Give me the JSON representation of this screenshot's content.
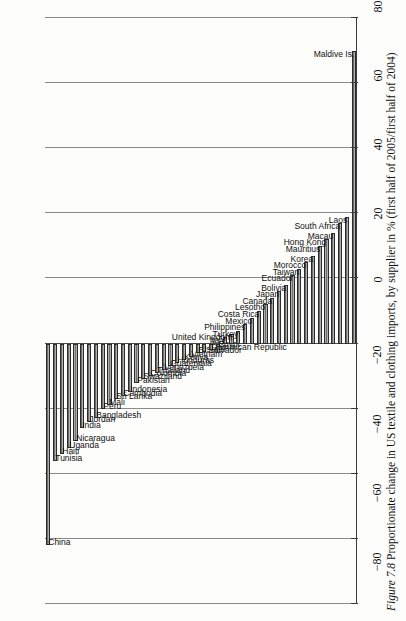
{
  "caption": {
    "figure_number": "Figure 7.8",
    "text": "Proportionate change in US textile and clothing imports, by supplier in % (first half of 2005/first half of 2004)"
  },
  "axis": {
    "ticks": [
      "80",
      "60",
      "40",
      "20",
      "0",
      "-20",
      "-40",
      "-60",
      "-80",
      "-100"
    ],
    "min": -100,
    "max": 80,
    "step": 20,
    "unit": "%"
  },
  "colors": {
    "bar_fill": "#6e6e6e",
    "bar_stroke": "#2b2b2b",
    "grid": "#8a8a8a",
    "axis": "#3a3a3a",
    "text": "#101010"
  },
  "chart_data": {
    "type": "bar",
    "title": "Proportionate change in US textile and clothing imports, by supplier in % (first half of 2005/first half of 2004)",
    "xlabel": "",
    "ylabel": "%",
    "orientation": "vertical",
    "grid": true,
    "legend": false,
    "ylim": [
      -100,
      80
    ],
    "categories": [
      "China",
      "Tunisia",
      "Haiti",
      "Uganda",
      "Nicaragua",
      "India",
      "Jordan",
      "Bangladesh",
      "Peru",
      "Mali",
      "Sri Lanka",
      "Cambodia",
      "Indonesia",
      "Pakistan",
      "Swaziland",
      "Colombia",
      "Thailand",
      "Venezuela",
      "Guatemala",
      "Honduras",
      "Kenya",
      "Vietnam",
      "El Salvador",
      "Israel",
      "Dominican Republic",
      "Egypt",
      "Italy",
      "United Kingdom",
      "Turkey",
      "Philippines",
      "Mexico",
      "Costa Rica",
      "Lesotho",
      "Canada",
      "Japan",
      "Bolivia",
      "Ecuador",
      "Taiwan",
      "Morocco",
      "Korea",
      "Mauritius",
      "Hong Kong",
      "Macau",
      "South Africa",
      "Laos",
      "Maldive Is."
    ],
    "values": [
      62,
      36,
      34,
      32,
      30,
      26,
      24,
      23,
      20,
      19,
      17,
      16,
      15,
      12,
      11,
      10,
      9,
      8,
      7,
      6,
      5,
      4,
      3,
      2.5,
      2,
      1,
      -2,
      -3,
      -4,
      -6,
      -8,
      -10,
      -12,
      -14,
      -16,
      -18,
      -21,
      -23,
      -25,
      -27,
      -30,
      -32,
      -34,
      -37,
      -39,
      -90
    ]
  }
}
